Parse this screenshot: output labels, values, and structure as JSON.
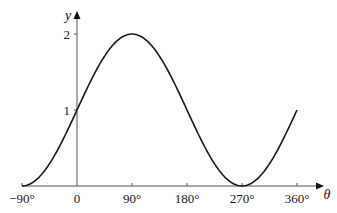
{
  "chart_data": {
    "type": "line",
    "title": "",
    "function": "y = 1 + sin(θ)",
    "xlabel": "θ",
    "ylabel": "y",
    "xlim": [
      -90,
      360
    ],
    "ylim": [
      0,
      2
    ],
    "x_ticks": [
      -90,
      0,
      90,
      180,
      270,
      360
    ],
    "x_tick_labels": [
      "−90°",
      "0",
      "90°",
      "180°",
      "270°",
      "360°"
    ],
    "y_ticks": [
      1,
      2
    ],
    "y_tick_labels": [
      "1",
      "2"
    ],
    "grid": false,
    "legend": null,
    "series": [
      {
        "name": "y = 1 + sin θ",
        "x": [
          -90,
          -60,
          -30,
          0,
          30,
          60,
          90,
          120,
          150,
          180,
          210,
          240,
          270,
          300,
          330,
          360
        ],
        "values": [
          0,
          0.134,
          0.5,
          1,
          1.5,
          1.866,
          2,
          1.866,
          1.5,
          1,
          0.5,
          0.134,
          0,
          0.134,
          0.5,
          1
        ]
      }
    ],
    "colors": {
      "curve": "#1a1a1a",
      "axes": "#555555"
    }
  }
}
